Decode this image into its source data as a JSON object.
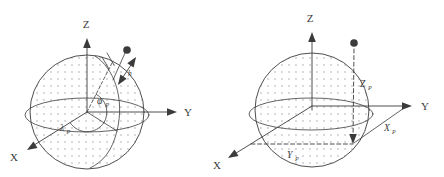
{
  "figure": {
    "colors": {
      "stroke": "#3b3b3b",
      "dot_fill": "#c9c9c9",
      "background": "#ffffff"
    },
    "left_diagram": {
      "axes": {
        "z": "Z",
        "y": "Y",
        "x": "X"
      },
      "labels": {
        "latitude_symbol": "φ",
        "latitude_sub": "P",
        "longitude_symbol": "λ",
        "longitude_sub": "P",
        "height": "h"
      }
    },
    "right_diagram": {
      "axes": {
        "z": "Z",
        "y": "Y",
        "x": "X"
      },
      "labels": {
        "z_coord": "Z",
        "z_coord_sub": "P",
        "x_coord": "X",
        "x_coord_sub": "P",
        "y_coord": "Y",
        "y_coord_sub": "P"
      }
    }
  }
}
